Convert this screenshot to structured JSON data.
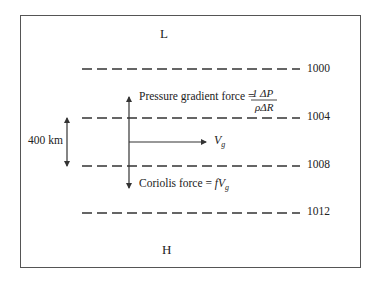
{
  "diagram": {
    "low_label": "L",
    "high_label": "H",
    "distance_label": "400 km",
    "isobars": [
      {
        "value": "1000",
        "y": 69
      },
      {
        "value": "1004",
        "y": 118
      },
      {
        "value": "1008",
        "y": 166
      },
      {
        "value": "1012",
        "y": 213
      }
    ],
    "pressure_force_label": "Pressure gradient force = ",
    "pressure_formula_numerator": "1 ΔP",
    "pressure_formula_denominator": "ρΔR",
    "wind_label": "V",
    "wind_subscript": "g",
    "coriolis_label": "Coriolis force = ",
    "coriolis_formula": "fV",
    "coriolis_subscript": "g",
    "colors": {
      "line": "#333333",
      "text": "#222222",
      "frame": "#555555"
    }
  }
}
